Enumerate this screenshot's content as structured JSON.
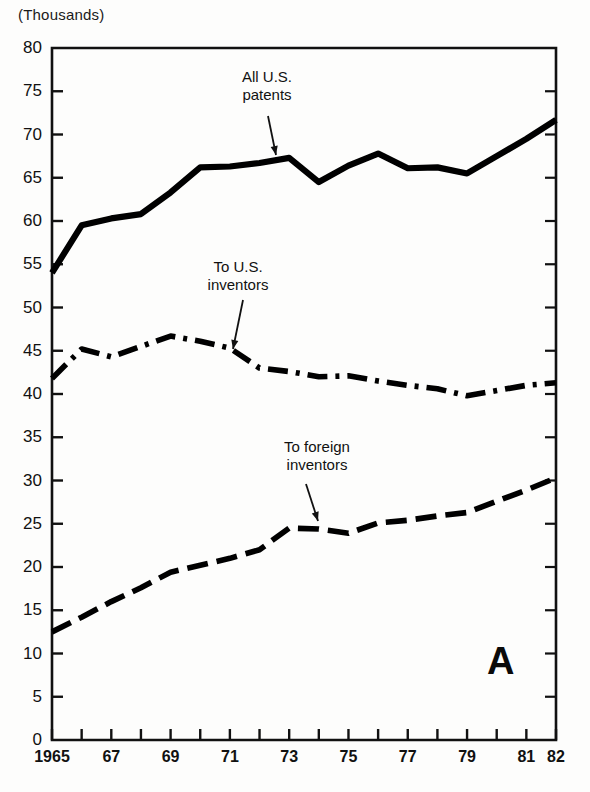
{
  "figure": {
    "units_label": "(Thousands)",
    "panel_letter": "A"
  },
  "annotations": [
    {
      "name": "all-us-patents",
      "text": "All U.S.\npatents"
    },
    {
      "name": "to-us-inventors",
      "text": "To U.S.\ninventors"
    },
    {
      "name": "to-foreign-inventors",
      "text": "To foreign\ninventors"
    }
  ],
  "chart_data": {
    "type": "line",
    "title": "",
    "subtitle": "",
    "xlabel": "",
    "ylabel": "(Thousands)",
    "xlim": [
      1965,
      1982
    ],
    "ylim": [
      0,
      80
    ],
    "grid": false,
    "legend_position": "inline-annotations",
    "panel_label": "A",
    "x": [
      1965,
      1966,
      1967,
      1968,
      1969,
      1970,
      1971,
      1972,
      1973,
      1974,
      1975,
      1976,
      1977,
      1978,
      1979,
      1980,
      1981,
      1982
    ],
    "xtick_labels": [
      "1965",
      "",
      "67",
      "",
      "69",
      "",
      "71",
      "",
      "73",
      "",
      "75",
      "",
      "77",
      "",
      "79",
      "",
      "81",
      "82"
    ],
    "xticks_shown": [
      "1965",
      "67",
      "69",
      "71",
      "73",
      "75",
      "77",
      "79",
      "81",
      "82"
    ],
    "yticks": [
      0,
      5,
      10,
      15,
      20,
      25,
      30,
      35,
      40,
      45,
      50,
      55,
      60,
      65,
      70,
      75,
      80
    ],
    "series": [
      {
        "name": "All U.S. patents",
        "style": "solid",
        "color": "#000000",
        "values": [
          54.0,
          59.5,
          60.3,
          60.8,
          63.3,
          66.2,
          66.3,
          66.7,
          67.3,
          64.5,
          66.4,
          67.8,
          66.1,
          66.2,
          65.5,
          67.5,
          69.5,
          71.7
        ]
      },
      {
        "name": "To U.S. inventors",
        "style": "dash-dot",
        "color": "#000000",
        "values": [
          41.8,
          45.2,
          44.3,
          45.5,
          46.7,
          46.1,
          45.3,
          43.0,
          42.6,
          42.0,
          42.1,
          41.5,
          41.0,
          40.6,
          39.8,
          40.4,
          41.0,
          41.3
        ]
      },
      {
        "name": "To foreign inventors",
        "style": "dashed",
        "color": "#000000",
        "values": [
          12.5,
          14.2,
          16.0,
          17.6,
          19.4,
          20.2,
          21.0,
          22.0,
          24.5,
          24.4,
          23.9,
          25.1,
          25.4,
          25.9,
          26.3,
          27.6,
          28.9,
          30.3
        ]
      }
    ]
  },
  "axes_geometry": {
    "left_px": 52,
    "right_px": 556,
    "top_px": 48,
    "bottom_px": 740
  }
}
